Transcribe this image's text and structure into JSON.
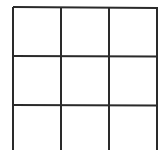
{
  "diagram": {
    "title": "",
    "rows": 3,
    "cols": 3,
    "line_color": "#2a2a2a",
    "line_width": 2,
    "vertical_lines_x": [
      13,
      61,
      109,
      157
    ],
    "horizontal_lines_y": [
      7,
      56,
      105
    ],
    "bottom_y": 150
  }
}
